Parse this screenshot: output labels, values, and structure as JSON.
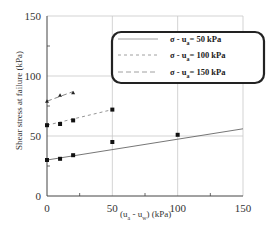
{
  "chart_data": {
    "type": "line",
    "title": "",
    "xlabel": "(u_a - u_w) (kPa)",
    "ylabel": "Shear stress at failure (kPa)",
    "xlim": [
      0,
      150
    ],
    "ylim": [
      0,
      150
    ],
    "x_ticks": [
      0,
      50,
      100,
      150
    ],
    "y_ticks": [
      0,
      50,
      100,
      150
    ],
    "grid": true,
    "legend_position": "upper right",
    "series": [
      {
        "name": "σ - u_a = 50 kPa",
        "line_style": "solid",
        "points": [
          [
            0,
            30
          ],
          [
            10,
            31
          ],
          [
            20,
            34
          ],
          [
            50,
            45
          ],
          [
            100,
            51
          ]
        ],
        "fit_line": [
          [
            0,
            30
          ],
          [
            150,
            56
          ]
        ]
      },
      {
        "name": "σ - u_a = 100 kPa",
        "line_style": "dotted",
        "points": [
          [
            0,
            59
          ],
          [
            10,
            60
          ],
          [
            20,
            63
          ],
          [
            50,
            72
          ]
        ],
        "fit_line": [
          [
            0,
            59
          ],
          [
            50,
            72
          ]
        ]
      },
      {
        "name": "σ - u_a = 150 kPa",
        "line_style": "dashed",
        "points": [
          [
            0,
            79
          ],
          [
            10,
            84
          ],
          [
            20,
            86
          ]
        ],
        "fit_line": [
          [
            0,
            79
          ],
          [
            20,
            87
          ]
        ]
      }
    ]
  },
  "axes": {
    "x_tick_labels": [
      "0",
      "50",
      "100",
      "150"
    ],
    "y_tick_labels": [
      "0",
      "50",
      "100",
      "150"
    ],
    "xlabel_main": "(u",
    "xlabel_sub_a": "a",
    "xlabel_mid": " - u",
    "xlabel_sub_w": "w",
    "xlabel_end": ")  (kPa)",
    "ylabel": "Shear stress at failure  (kPa)"
  },
  "legend": {
    "items": [
      {
        "sigma": "σ - u",
        "sub": "a",
        "value": "= 50 kPa"
      },
      {
        "sigma": "σ - u",
        "sub": "a",
        "value": "= 100 kPa"
      },
      {
        "sigma": "σ - u",
        "sub": "a",
        "value": "= 150 kPa"
      }
    ]
  }
}
